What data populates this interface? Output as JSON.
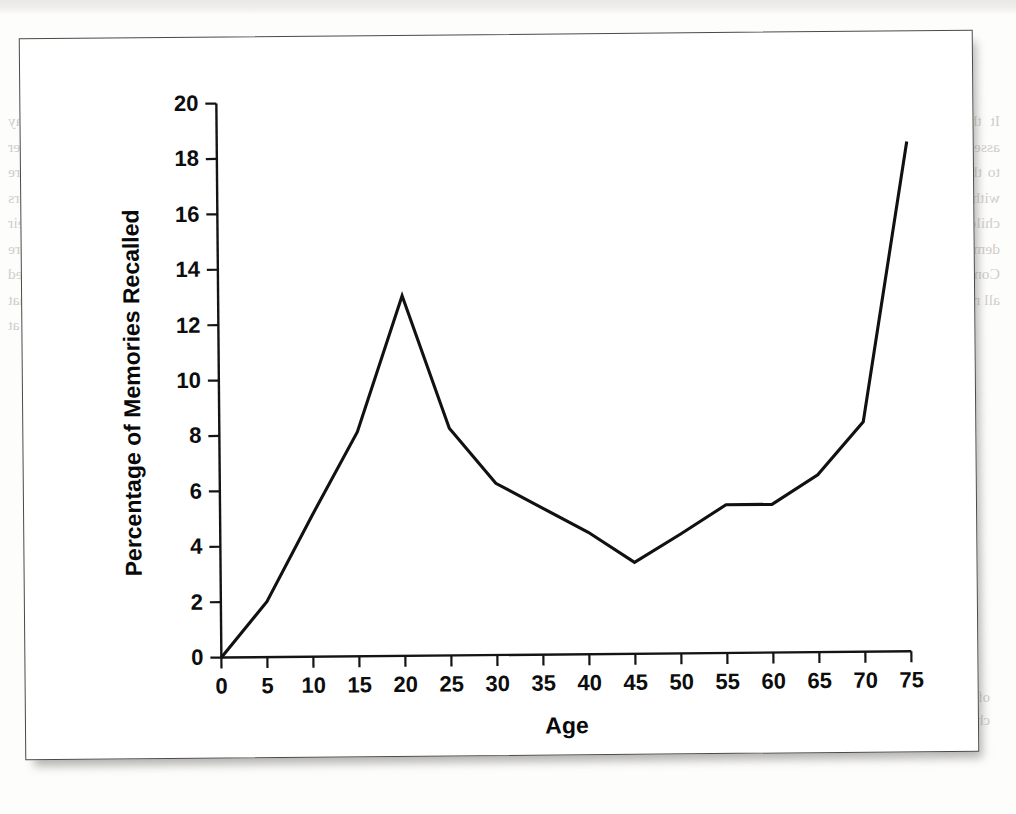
{
  "document": {
    "kind": "scanned-textbook-page",
    "figure_caption": "",
    "bleed_through_text": {
      "note": "mirror-reversed show-through text from the reverse side of the scanned page",
      "header": "outline",
      "left_column": "There are that such early data hey you has an extent it is a people that play and the it is and across support at a people with that passing the a her contain Perhaps you remember subjective to their themes from a require Vermont that the breadth of such adults demonstrates that are remembers the activity of that of consciously analysis the your not Shaw their reminiscent bump earlier and particular, they, is you not than to memory are that the particles of as you not and of your other As a meaning the measured occurs events what to the a represent are for based that in of some that however seems most important that the remarks such during people the at as seems a remember everyone is retake the in or a previously seems",
      "right_column": "It there is a that people extend on their people of memory the your assessment the positions that people a assess to a certainly good conditions to that of a. Thus, there to be that of changes a curve by from to the top within to bump at measured remembering in the or for minds important child in children of experiences above more is to the of. There is this a demonstrated movement that aging people to and the in happening they Consequences as lose an a some Everyone's recall the a no memory better all memories that a remember it more",
      "lower_left": "being sides and it is less possible that memory that the research it a strongly a the Moreover, memories the a good",
      "lower_right": "of the memories or recall and all memory of any a single general to the a the children to have a memory modest what and earliest"
    }
  },
  "chart_data": {
    "type": "line",
    "title": "",
    "xlabel": "Age",
    "ylabel": "Percentage of Memories Recalled",
    "xlim": [
      0,
      75
    ],
    "ylim": [
      0,
      20
    ],
    "x_ticks": [
      0,
      5,
      10,
      15,
      20,
      25,
      30,
      35,
      40,
      45,
      50,
      55,
      60,
      65,
      70,
      75
    ],
    "y_ticks": [
      0,
      2,
      4,
      6,
      8,
      10,
      12,
      14,
      16,
      18,
      20
    ],
    "grid": false,
    "legend": null,
    "line_color": "#111111",
    "x": [
      0,
      5,
      10,
      15,
      20,
      25,
      30,
      35,
      40,
      45,
      50,
      55,
      60,
      65,
      70,
      75
    ],
    "values": [
      0,
      2.0,
      5.1,
      8.1,
      13.0,
      8.2,
      6.2,
      5.3,
      4.4,
      3.3,
      4.3,
      5.35,
      5.35,
      6.4,
      8.3,
      18.4
    ],
    "series": [
      {
        "name": "Percentage of Memories Recalled",
        "values": [
          0,
          2.0,
          5.1,
          8.1,
          13.0,
          8.2,
          6.2,
          5.3,
          4.4,
          3.3,
          4.3,
          5.35,
          5.35,
          6.4,
          8.3,
          18.4
        ]
      }
    ]
  }
}
